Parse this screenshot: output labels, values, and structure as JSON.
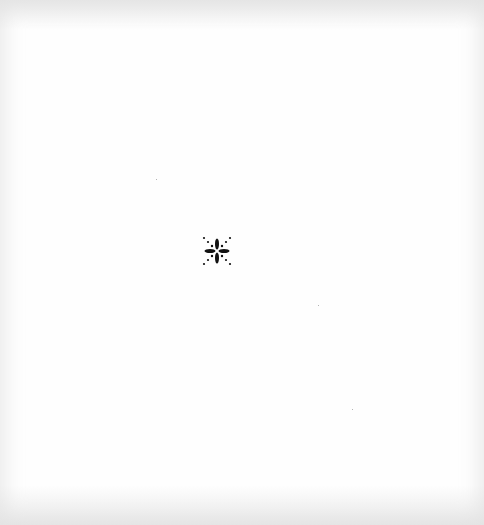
{
  "document": {
    "type": "blank-page-with-ornament",
    "background_color": "#fefefe",
    "ornament": {
      "icon": "fleuron-asterisk-icon",
      "color": "#111111",
      "position": {
        "x": 217,
        "y": 251
      }
    },
    "specks": [
      {
        "x": 156,
        "y": 179
      },
      {
        "x": 318,
        "y": 305
      },
      {
        "x": 352,
        "y": 409
      }
    ]
  }
}
